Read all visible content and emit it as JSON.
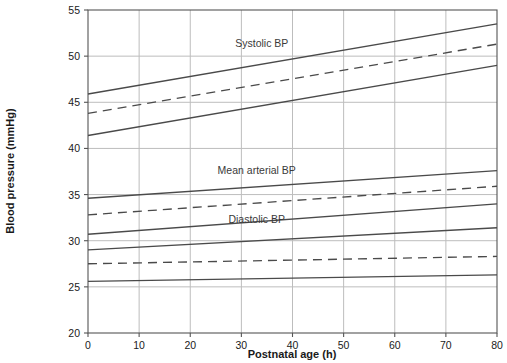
{
  "chart_data": {
    "type": "line",
    "title": "",
    "xlabel": "Postnatal age (h)",
    "ylabel": "Blood pressure (mmHg)",
    "xlim": [
      0,
      80
    ],
    "ylim": [
      20,
      55
    ],
    "xticks": [
      0,
      10,
      20,
      30,
      40,
      50,
      60,
      70,
      80
    ],
    "yticks": [
      20,
      25,
      30,
      35,
      40,
      45,
      50,
      55
    ],
    "xtick_labels": [
      "0",
      "10",
      "20",
      "30",
      "40",
      "50",
      "60",
      "70",
      "80"
    ],
    "ytick_labels": [
      "20",
      "25",
      "30",
      "35",
      "40",
      "45",
      "50",
      "55"
    ],
    "grid": true,
    "legend": "none",
    "annotations": [
      {
        "text": "Systolic BP",
        "x": 34,
        "y": 51.0
      },
      {
        "text": "Mean arterial BP",
        "x": 33,
        "y": 37.2
      },
      {
        "text": "Diastolic BP",
        "x": 33,
        "y": 31.9
      }
    ],
    "x": [
      0,
      80
    ],
    "series": [
      {
        "name": "Systolic BP upper",
        "group": "Systolic BP",
        "style": "solid",
        "values": [
          45.9,
          53.5
        ]
      },
      {
        "name": "Systolic BP median",
        "group": "Systolic BP",
        "style": "dashed",
        "values": [
          43.8,
          51.3
        ]
      },
      {
        "name": "Systolic BP lower",
        "group": "Systolic BP",
        "style": "solid",
        "values": [
          41.4,
          49.0
        ]
      },
      {
        "name": "Mean arterial BP upper",
        "group": "Mean arterial BP",
        "style": "solid",
        "values": [
          34.6,
          37.6
        ]
      },
      {
        "name": "Mean arterial BP median",
        "group": "Mean arterial BP",
        "style": "dashed",
        "values": [
          32.8,
          35.9
        ]
      },
      {
        "name": "Mean arterial BP lower",
        "group": "Mean arterial BP",
        "style": "solid",
        "values": [
          30.7,
          34.0
        ]
      },
      {
        "name": "Diastolic BP upper",
        "group": "Diastolic BP",
        "style": "solid",
        "values": [
          29.0,
          31.4
        ]
      },
      {
        "name": "Diastolic BP median",
        "group": "Diastolic BP",
        "style": "dashed",
        "values": [
          27.5,
          28.3
        ]
      },
      {
        "name": "Diastolic BP lower",
        "group": "Diastolic BP",
        "style": "solid",
        "values": [
          25.6,
          26.3
        ]
      }
    ],
    "colors": {
      "line": "#4a4a4a",
      "grid": "#bdbdbd",
      "axis": "#555555",
      "text": "#1a1a1a",
      "background": "#ffffff"
    }
  }
}
